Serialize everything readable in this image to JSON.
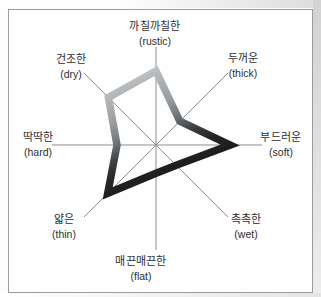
{
  "figure": {
    "description_visible_text_only": true
  },
  "colors": {
    "band_light": "#c8cbcc",
    "band_mid": "#707477",
    "band_dark": "#17181a",
    "axis_line": "#8d8d8d",
    "text": "#2e2e2e",
    "frame_border": "#9b9b9b"
  },
  "chart_data": {
    "type": "radar",
    "title": "",
    "grid": false,
    "legend": false,
    "value_range": [
      0,
      1
    ],
    "center": {
      "x": 156,
      "y": 145
    },
    "band_stroke_width": 7.5,
    "axes": [
      {
        "key": "rustic",
        "label_ko": "까칠까칠한",
        "label_en": "(rustic)",
        "angle_deg": 90,
        "line_len": 98,
        "value": 0.755,
        "label_x": 155,
        "label_y": 19
      },
      {
        "key": "thick",
        "label_ko": "두꺼운",
        "label_en": "(thick)",
        "angle_deg": 45,
        "line_len": 102,
        "value": 0.33,
        "label_x": 243,
        "label_y": 51
      },
      {
        "key": "soft",
        "label_ko": "부드러운",
        "label_en": "(soft)",
        "angle_deg": 0,
        "line_len": 106,
        "value": 0.7,
        "label_x": 281,
        "label_y": 130
      },
      {
        "key": "wet",
        "label_ko": "촉촉한",
        "label_en": "(wet)",
        "angle_deg": -45,
        "line_len": 102,
        "value": 0.28,
        "label_x": 246,
        "label_y": 212
      },
      {
        "key": "flat",
        "label_ko": "매끈매끈한",
        "label_en": "(flat)",
        "angle_deg": -90,
        "line_len": 105,
        "value": 0.27,
        "label_x": 141,
        "label_y": 254
      },
      {
        "key": "thin",
        "label_ko": "얇은",
        "label_en": "(thin)",
        "angle_deg": -135,
        "line_len": 102,
        "value": 0.67,
        "label_x": 64,
        "label_y": 212
      },
      {
        "key": "hard",
        "label_ko": "딱딱한",
        "label_en": "(hard)",
        "angle_deg": 180,
        "line_len": 104,
        "value": 0.375,
        "label_x": 38,
        "label_y": 130
      },
      {
        "key": "dry",
        "label_ko": "건조한",
        "label_en": "(dry)",
        "angle_deg": 135,
        "line_len": 102,
        "value": 0.66,
        "label_x": 71,
        "label_y": 52
      }
    ]
  }
}
